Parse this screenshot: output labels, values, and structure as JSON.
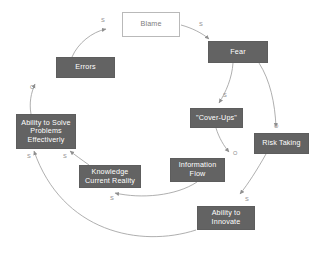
{
  "diagram": {
    "style": {
      "node_fill": "#636363",
      "node_text": "#ffffff",
      "plain_fill": "#ffffff",
      "plain_text": "#7d7d7d",
      "plain_border": "#b9b9b9",
      "arrow_color": "#9a9a9a",
      "label_color": "#8a8a8a",
      "background": "#ffffff"
    },
    "nodes": [
      {
        "id": "blame",
        "label": "Blame",
        "kind": "plain",
        "x": 122,
        "y": 12,
        "w": 58,
        "h": 25
      },
      {
        "id": "fear",
        "label": "Fear",
        "kind": "solid",
        "x": 208,
        "y": 41,
        "w": 60,
        "h": 22
      },
      {
        "id": "errors",
        "label": "Errors",
        "kind": "solid",
        "x": 56,
        "y": 57,
        "w": 59,
        "h": 21
      },
      {
        "id": "coverups",
        "label": "\"Cover-Ups\"",
        "kind": "solid",
        "x": 190,
        "y": 108,
        "w": 53,
        "h": 20
      },
      {
        "id": "risktaking",
        "label": "Risk Taking",
        "kind": "solid",
        "x": 254,
        "y": 133,
        "w": 55,
        "h": 21
      },
      {
        "id": "ability",
        "label": "Ability to Solve\nProblems\nEffectiverly",
        "kind": "solid",
        "x": 16,
        "y": 114,
        "w": 60,
        "h": 35
      },
      {
        "id": "knowledge",
        "label": "Knowledge\nCurrent Reality",
        "kind": "solid",
        "x": 79,
        "y": 165,
        "w": 62,
        "h": 23
      },
      {
        "id": "infoflow",
        "label": "Information\nFlow",
        "kind": "solid",
        "x": 170,
        "y": 158,
        "w": 55,
        "h": 24
      },
      {
        "id": "innovate",
        "label": "Ability to\nInnovate",
        "kind": "solid",
        "x": 197,
        "y": 206,
        "w": 58,
        "h": 24
      }
    ],
    "edges": [
      {
        "id": "errors-to-blame",
        "from": "errors",
        "to": "blame",
        "polarity": "S",
        "label_x": 101,
        "label_y": 17
      },
      {
        "id": "blame-to-fear",
        "from": "blame",
        "to": "fear",
        "polarity": "S",
        "label_x": 199,
        "label_y": 21
      },
      {
        "id": "fear-to-coverups",
        "from": "fear",
        "to": "coverups",
        "polarity": "S",
        "label_x": 223,
        "label_y": 92
      },
      {
        "id": "fear-to-risktaking",
        "from": "fear",
        "to": "risktaking",
        "polarity": "O",
        "label_x": 274,
        "label_y": 123
      },
      {
        "id": "coverups-to-infoflow",
        "from": "coverups",
        "to": "infoflow",
        "polarity": "O",
        "label_x": 233,
        "label_y": 150
      },
      {
        "id": "risk-to-innovate",
        "from": "risktaking",
        "to": "innovate",
        "polarity": "S",
        "label_x": 245,
        "label_y": 196
      },
      {
        "id": "infoflow-to-knowledge",
        "from": "infoflow",
        "to": "knowledge",
        "polarity": "S",
        "label_x": 110,
        "label_y": 195
      },
      {
        "id": "knowledge-to-ability",
        "from": "knowledge",
        "to": "ability",
        "polarity": "S",
        "label_x": 63,
        "label_y": 153
      },
      {
        "id": "innovate-to-ability",
        "from": "innovate",
        "to": "ability",
        "polarity": "S",
        "label_x": 27,
        "label_y": 153
      },
      {
        "id": "ability-to-errors",
        "from": "ability",
        "to": "errors",
        "polarity": "O",
        "label_x": 30,
        "label_y": 84
      }
    ]
  }
}
